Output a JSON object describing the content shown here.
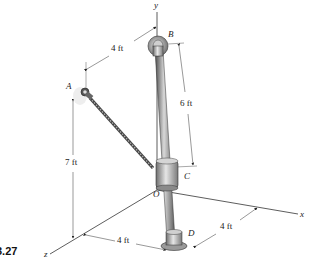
{
  "figure": {
    "number": "3.27"
  },
  "axes": {
    "x": "x",
    "y": "y",
    "z": "z",
    "origin": "O"
  },
  "points": {
    "A": "A",
    "B": "B",
    "C": "C",
    "D": "D"
  },
  "dimensions": {
    "top_horizontal": "4 ft",
    "vertical_A": "7 ft",
    "BC": "6 ft",
    "bottom_z": "4 ft",
    "bottom_x": "4 ft"
  },
  "colors": {
    "line": "#333333",
    "rod_dark": "#555555",
    "rod_light": "#c9c9c9",
    "cable": "#6a6a6a"
  }
}
